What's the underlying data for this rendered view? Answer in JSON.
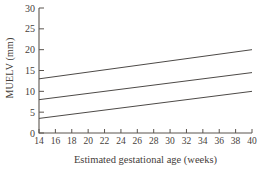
{
  "colors": {
    "axis": "#5b554f",
    "text": "#46403a",
    "line": "#4d4a47",
    "background": "#ffffff"
  },
  "chart_data": {
    "type": "line",
    "title": "",
    "xlabel": "Estimated gestational age (weeks)",
    "ylabel": "MUELV (mm)",
    "xlim": [
      14,
      40
    ],
    "ylim": [
      0,
      30
    ],
    "x_ticks": [
      14,
      16,
      18,
      20,
      22,
      24,
      26,
      28,
      30,
      32,
      34,
      36,
      38,
      40
    ],
    "y_ticks": [
      0,
      5,
      10,
      15,
      20,
      25,
      30
    ],
    "grid": false,
    "legend": "none",
    "series": [
      {
        "name": "upper-percentile-line",
        "x": [
          14,
          40
        ],
        "values": [
          13,
          20
        ]
      },
      {
        "name": "mean-line",
        "x": [
          14,
          40
        ],
        "values": [
          8,
          14.5
        ]
      },
      {
        "name": "lower-percentile-line",
        "x": [
          14,
          40
        ],
        "values": [
          3.5,
          10
        ]
      }
    ]
  }
}
